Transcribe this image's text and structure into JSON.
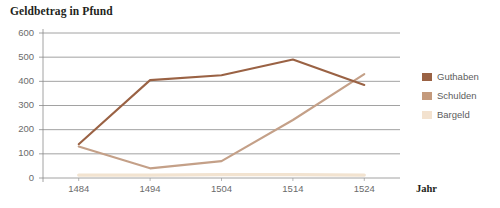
{
  "chart_data": {
    "type": "line",
    "title": "Geldbetrag in Pfund",
    "xlabel": "Jahr",
    "ylabel": "",
    "categories": [
      "1484",
      "1494",
      "1504",
      "1514",
      "1524"
    ],
    "x": [
      1484,
      1494,
      1504,
      1514,
      1524
    ],
    "xlim": [
      1479,
      1529
    ],
    "ylim": [
      0,
      600
    ],
    "yticks": [
      0,
      100,
      200,
      300,
      400,
      500,
      600
    ],
    "ytick_labels": [
      "0",
      "100",
      "200",
      "300",
      "400",
      "500",
      "600"
    ],
    "grid": "horizontal",
    "legend_position": "right",
    "series": [
      {
        "name": "Guthaben",
        "color": "#9a6244",
        "values": [
          140,
          405,
          425,
          490,
          385
        ]
      },
      {
        "name": "Schulden",
        "color": "#c4a088",
        "values": [
          130,
          40,
          70,
          240,
          430
        ]
      },
      {
        "name": "Bargeld",
        "color": "#f2e3d0",
        "values": [
          12,
          12,
          14,
          14,
          12
        ]
      }
    ]
  },
  "legend": {
    "items": [
      {
        "label": "Guthaben",
        "color": "#9a6244"
      },
      {
        "label": "Schulden",
        "color": "#c49a7c"
      },
      {
        "label": "Bargeld",
        "color": "#f3e2cf"
      }
    ]
  },
  "axes": {
    "x_axis_name": "Jahr"
  }
}
